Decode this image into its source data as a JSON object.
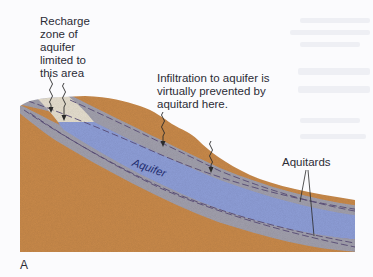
{
  "figure": {
    "panel_letter": "A",
    "labels": {
      "recharge_zone": "Recharge\nzone of\naquifer\nlimited to\nthis area",
      "infiltration": "Infiltration to aquifer is\nvirtually prevented by\naquitard here.",
      "aquifer": "Aquifer",
      "aquitards": "Aquitards"
    },
    "colors": {
      "soil": "#c98a4b",
      "aquifer": "#8f9fd8",
      "aquitard": "#a2a0ad",
      "recharge_zone": "#e6dfcf",
      "background": "#fbfbfd"
    },
    "arrows": [
      {
        "name": "recharge-arrow-1"
      },
      {
        "name": "recharge-arrow-2"
      },
      {
        "name": "infiltration-arrow-1"
      },
      {
        "name": "infiltration-arrow-2"
      }
    ]
  }
}
